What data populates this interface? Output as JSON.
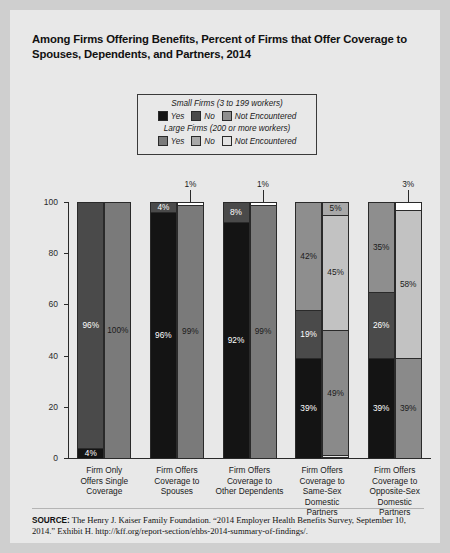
{
  "title": "Among Firms Offering Benefits, Percent of Firms that Offer Coverage to Spouses, Dependents, and Partners, 2014",
  "legend": {
    "small_heading": "Small Firms (3 to 199 workers)",
    "large_heading": "Large Firms (200 or more workers)",
    "small_items": [
      {
        "label": "Yes",
        "color": "#141414"
      },
      {
        "label": "No",
        "color": "#4a4a4a"
      },
      {
        "label": "Not Encountered",
        "color": "#8e8e8e"
      }
    ],
    "large_items": [
      {
        "label": "Yes",
        "color": "#7a7a7a"
      },
      {
        "label": "No",
        "color": "#a8a8a8"
      },
      {
        "label": "Not Encountered",
        "color": "#e2e2e2"
      }
    ]
  },
  "source": {
    "prefix": "SOURCE:",
    "text": " The Henry J. Kaiser Family Foundation. “2014 Employer Health Benefits Survey, September 10, 2014.” Exhibit H. http://kff.org/report-section/ehbs-2014-summary-of-findings/."
  },
  "chart_data": {
    "type": "bar",
    "subtype": "stacked-grouped-100",
    "title": "Among Firms Offering Benefits, Percent of Firms that Offer Coverage to Spouses, Dependents, and Partners, 2014",
    "xlabel": "",
    "ylabel": "",
    "ylim": [
      0,
      100
    ],
    "yticks": [
      0,
      20,
      40,
      60,
      80,
      100
    ],
    "ytick_labels": [
      "0",
      "20",
      "40",
      "60",
      "80",
      "100"
    ],
    "grid": false,
    "legend_position": "top-center",
    "categories": [
      "Firm Only Offers Single Coverage",
      "Firm Offers Coverage to Spouses",
      "Firm Offers Coverage to Other Dependents",
      "Firm Offers Coverage to Same-Sex Domestic Partners",
      "Firm Offers Coverage to Opposite-Sex Domestic Partners"
    ],
    "category_lines": [
      [
        "Firm Only",
        "Offers Single",
        "Coverage"
      ],
      [
        "Firm Offers",
        "Coverage to",
        "Spouses"
      ],
      [
        "Firm Offers",
        "Coverage to",
        "Other Dependents"
      ],
      [
        "Firm Offers",
        "Coverage to",
        "Same-Sex",
        "Domestic",
        "Partners"
      ],
      [
        "Firm Offers",
        "Coverage to",
        "Opposite-Sex",
        "Domestic",
        "Partners"
      ]
    ],
    "series": [
      {
        "name": "Small Firms — Yes",
        "firm": "small",
        "color": "#141414",
        "values": [
          4,
          96,
          92,
          39,
          39
        ]
      },
      {
        "name": "Small Firms — No",
        "firm": "small",
        "color": "#4a4a4a",
        "values": [
          96,
          4,
          8,
          19,
          26
        ]
      },
      {
        "name": "Small Firms — Not Encountered",
        "firm": "small",
        "color": "#8e8e8e",
        "values": [
          0,
          0,
          0,
          42,
          35
        ]
      },
      {
        "name": "Large Firms — Yes",
        "firm": "large",
        "color": "#7a7a7a",
        "values": [
          100,
          99,
          99,
          49,
          39
        ]
      },
      {
        "name": "Large Firms — No",
        "firm": "large",
        "color": "#a8a8a8",
        "values": [
          0,
          0,
          0,
          45,
          58
        ]
      },
      {
        "name": "Large Firms — Not Encountered",
        "firm": "large",
        "color": "#e2e2e2",
        "values": [
          0,
          1,
          1,
          5,
          3
        ]
      }
    ],
    "groups": [
      {
        "category": "Firm Only Offers Single Coverage",
        "small": [
          {
            "key": "Not Encountered",
            "value": 0,
            "label": "",
            "color": "#8e8e8e",
            "label_color": "#ffffff",
            "inside": true
          },
          {
            "key": "No",
            "value": 96,
            "label": "96%",
            "color": "#4a4a4a",
            "label_color": "#ffffff",
            "inside": true
          },
          {
            "key": "Yes",
            "value": 4,
            "label": "4%",
            "color": "#141414",
            "label_color": "#ffffff",
            "inside": true
          }
        ],
        "large": [
          {
            "key": "Not Encountered",
            "value": 0,
            "label": "",
            "color": "#e2e2e2",
            "label_color": "#1a1a1a",
            "inside": true
          },
          {
            "key": "No",
            "value": 0,
            "label": "",
            "color": "#a8a8a8",
            "label_color": "#1a1a1a",
            "inside": true
          },
          {
            "key": "Yes",
            "value": 100,
            "label": "100%",
            "color": "#7a7a7a",
            "label_color": "#1a1a1a",
            "inside": true
          }
        ]
      },
      {
        "category": "Firm Offers Coverage to Spouses",
        "small": [
          {
            "key": "Not Encountered",
            "value": 0,
            "label": "",
            "color": "#8e8e8e",
            "label_color": "#ffffff",
            "inside": true
          },
          {
            "key": "No",
            "value": 4,
            "label": "4%",
            "color": "#4a4a4a",
            "label_color": "#ffffff",
            "inside": true
          },
          {
            "key": "Yes",
            "value": 96,
            "label": "96%",
            "color": "#141414",
            "label_color": "#ffffff",
            "inside": true
          }
        ],
        "large": [
          {
            "key": "Not Encountered",
            "value": 1,
            "label": "1%",
            "color": "#ffffff",
            "label_color": "#1a1a1a",
            "inside": false
          },
          {
            "key": "No",
            "value": 0,
            "label": "",
            "color": "#a8a8a8",
            "label_color": "#1a1a1a",
            "inside": true
          },
          {
            "key": "Yes",
            "value": 99,
            "label": "99%",
            "color": "#7a7a7a",
            "label_color": "#1a1a1a",
            "inside": true
          }
        ]
      },
      {
        "category": "Firm Offers Coverage to Other Dependents",
        "small": [
          {
            "key": "Not Encountered",
            "value": 0,
            "label": "",
            "color": "#8e8e8e",
            "label_color": "#ffffff",
            "inside": true
          },
          {
            "key": "No",
            "value": 8,
            "label": "8%",
            "color": "#4a4a4a",
            "label_color": "#ffffff",
            "inside": true
          },
          {
            "key": "Yes",
            "value": 92,
            "label": "92%",
            "color": "#141414",
            "label_color": "#ffffff",
            "inside": true
          }
        ],
        "large": [
          {
            "key": "Not Encountered",
            "value": 1,
            "label": "1%",
            "color": "#ffffff",
            "label_color": "#1a1a1a",
            "inside": false
          },
          {
            "key": "No",
            "value": 0,
            "label": "",
            "color": "#a8a8a8",
            "label_color": "#1a1a1a",
            "inside": true
          },
          {
            "key": "Yes",
            "value": 99,
            "label": "99%",
            "color": "#7a7a7a",
            "label_color": "#1a1a1a",
            "inside": true
          }
        ]
      },
      {
        "category": "Firm Offers Coverage to Same-Sex Domestic Partners",
        "small": [
          {
            "key": "Not Encountered",
            "value": 42,
            "label": "42%",
            "color": "#8e8e8e",
            "label_color": "#1a1a1a",
            "inside": true
          },
          {
            "key": "No",
            "value": 19,
            "label": "19%",
            "color": "#4a4a4a",
            "label_color": "#ffffff",
            "inside": true
          },
          {
            "key": "Yes",
            "value": 39,
            "label": "39%",
            "color": "#141414",
            "label_color": "#ffffff",
            "inside": true
          }
        ],
        "large": [
          {
            "key": "Not Encountered",
            "value": 5,
            "label": "5%",
            "color": "#a8a8a8",
            "label_color": "#1a1a1a",
            "inside": true
          },
          {
            "key": "No",
            "value": 45,
            "label": "45%",
            "color": "#c2c2c2",
            "label_color": "#1a1a1a",
            "inside": true
          },
          {
            "key": "Yes",
            "value": 49,
            "label": "49%",
            "color": "#8a8a8a",
            "label_color": "#1a1a1a",
            "inside": true
          }
        ]
      },
      {
        "category": "Firm Offers Coverage to Opposite-Sex Domestic Partners",
        "small": [
          {
            "key": "Not Encountered",
            "value": 35,
            "label": "35%",
            "color": "#8e8e8e",
            "label_color": "#1a1a1a",
            "inside": true
          },
          {
            "key": "No",
            "value": 26,
            "label": "26%",
            "color": "#4a4a4a",
            "label_color": "#ffffff",
            "inside": true
          },
          {
            "key": "Yes",
            "value": 39,
            "label": "39%",
            "color": "#141414",
            "label_color": "#ffffff",
            "inside": true
          }
        ],
        "large": [
          {
            "key": "Not Encountered",
            "value": 3,
            "label": "3%",
            "color": "#ffffff",
            "label_color": "#1a1a1a",
            "inside": false
          },
          {
            "key": "No",
            "value": 58,
            "label": "58%",
            "color": "#c2c2c2",
            "label_color": "#1a1a1a",
            "inside": true
          },
          {
            "key": "Yes",
            "value": 39,
            "label": "39%",
            "color": "#8a8a8a",
            "label_color": "#1a1a1a",
            "inside": true
          }
        ]
      }
    ]
  }
}
